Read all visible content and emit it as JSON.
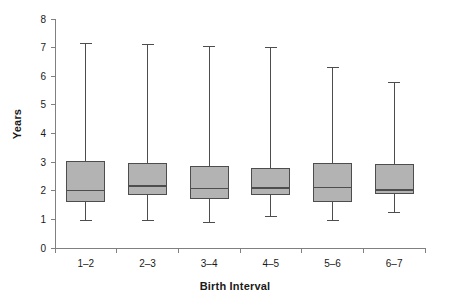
{
  "chart_data": {
    "type": "box",
    "title": "",
    "xlabel": "Birth Interval",
    "ylabel": "Years",
    "categories": [
      "1–2",
      "2–3",
      "3–4",
      "4–5",
      "5–6",
      "6–7"
    ],
    "ylim": [
      0,
      8
    ],
    "yticks": [
      0,
      1,
      2,
      3,
      4,
      5,
      6,
      7,
      8
    ],
    "ytick_labels": [
      "0",
      "1",
      "2",
      "3",
      "4",
      "5",
      "6",
      "7",
      "8"
    ],
    "grid": false,
    "legend": null,
    "box_fill_color": "#b3b3b3",
    "box_edge_color": "#4d4d4d",
    "axis_color": "#808080",
    "boxes": [
      {
        "category": "1–2",
        "whisker_low": 0.97,
        "q1": 1.62,
        "median": 2.0,
        "q3": 3.03,
        "whisker_high": 7.15
      },
      {
        "category": "2–3",
        "whisker_low": 0.97,
        "q1": 1.88,
        "median": 2.17,
        "q3": 2.95,
        "whisker_high": 7.1
      },
      {
        "category": "3–4",
        "whisker_low": 0.88,
        "q1": 1.72,
        "median": 2.07,
        "q3": 2.85,
        "whisker_high": 7.05
      },
      {
        "category": "4–5",
        "whisker_low": 1.1,
        "q1": 1.87,
        "median": 2.1,
        "q3": 2.78,
        "whisker_high": 7.02
      },
      {
        "category": "5–6",
        "whisker_low": 0.97,
        "q1": 1.62,
        "median": 2.12,
        "q3": 2.95,
        "whisker_high": 6.32
      },
      {
        "category": "6–7",
        "whisker_low": 1.25,
        "q1": 1.9,
        "median": 2.03,
        "q3": 2.93,
        "whisker_high": 5.78
      }
    ]
  }
}
